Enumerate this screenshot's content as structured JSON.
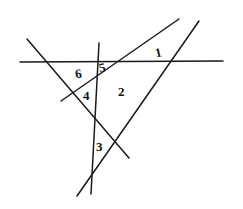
{
  "figure": {
    "width": 243,
    "height": 209,
    "background_color": "#ffffff",
    "ink_color": "#1a1a1a",
    "stroke_width": 1.5,
    "style": "hand-drawn pencil sketch"
  },
  "lines": [
    {
      "name": "horizontal-line",
      "description": "Long horizontal transversal across the middle-upper area",
      "x1": 20,
      "y1": 62,
      "x2": 223,
      "y2": 61
    },
    {
      "name": "descending-line",
      "description": "Line descending from upper-left to lower-right",
      "x1": 27,
      "y1": 39,
      "x2": 129,
      "y2": 158
    },
    {
      "name": "near-vertical-line",
      "description": "Steep near-vertical line from top to bottom",
      "x1": 99,
      "y1": 43,
      "x2": 91,
      "y2": 194
    },
    {
      "name": "ascending-line-long",
      "description": "Steep line ascending from lower-left to upper-right vertex",
      "x1": 77,
      "y1": 196,
      "x2": 199,
      "y2": 21
    },
    {
      "name": "ascending-line-short",
      "description": "Shallow line ascending from left-middle to upper-right vertex",
      "x1": 61,
      "y1": 101,
      "x2": 179,
      "y2": 19
    }
  ],
  "labels": [
    {
      "name": "angle-label-1",
      "text": "1",
      "x": 155,
      "y": 46,
      "rotation": -12
    },
    {
      "name": "angle-label-2",
      "text": "2",
      "x": 118,
      "y": 85,
      "rotation": 0
    },
    {
      "name": "angle-label-3",
      "text": "3",
      "x": 96,
      "y": 140,
      "rotation": 0
    },
    {
      "name": "angle-label-4",
      "text": "4",
      "x": 83,
      "y": 89,
      "rotation": 0
    },
    {
      "name": "angle-label-5",
      "text": "5",
      "x": 99,
      "y": 61,
      "rotation": -10
    },
    {
      "name": "angle-label-6",
      "text": "6",
      "x": 75,
      "y": 67,
      "rotation": -8
    }
  ],
  "intersections": [
    {
      "name": "vertex-top-right",
      "x": 187,
      "y": 31
    },
    {
      "name": "vertex-bottom-left",
      "x": 88,
      "y": 179
    },
    {
      "name": "crossing-center",
      "x": 108,
      "y": 143
    }
  ]
}
